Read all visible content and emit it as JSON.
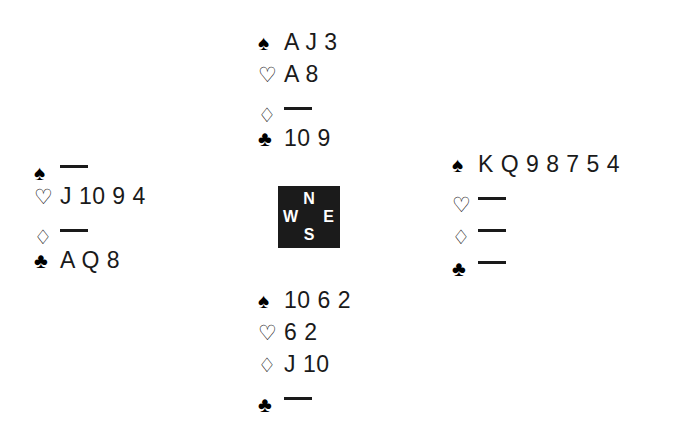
{
  "diagram": {
    "type": "bridge-hand-diagram",
    "background_color": "#ffffff",
    "ink_color": "#1a1a1a"
  },
  "suits": {
    "spade": {
      "symbol": "♠",
      "name": "spade-symbol",
      "filled": true
    },
    "heart": {
      "symbol": "♡",
      "name": "heart-symbol",
      "filled": false
    },
    "diamond": {
      "symbol": "♢",
      "name": "diamond-symbol",
      "filled": false
    },
    "club": {
      "symbol": "♣",
      "name": "club-symbol",
      "filled": true
    }
  },
  "void_marker": "—",
  "compass": {
    "background_color": "#1b1b1b",
    "text_color": "#ffffff",
    "north": "N",
    "west": "W",
    "east": "E",
    "south": "S"
  },
  "hands": {
    "north": {
      "label": "North",
      "spades": "A J 3",
      "hearts": "A 8",
      "diamonds": "",
      "clubs": "10 9",
      "diamonds_void": true,
      "spades_void": false,
      "hearts_void": false,
      "clubs_void": false
    },
    "west": {
      "label": "West",
      "spades": "",
      "hearts": "J 10 9 4",
      "diamonds": "",
      "clubs": "A Q 8",
      "spades_void": true,
      "hearts_void": false,
      "diamonds_void": true,
      "clubs_void": false
    },
    "east": {
      "label": "East",
      "spades": "K Q 9 8 7 5 4",
      "hearts": "",
      "diamonds": "",
      "clubs": "",
      "spades_void": false,
      "hearts_void": true,
      "diamonds_void": true,
      "clubs_void": true
    },
    "south": {
      "label": "South",
      "spades": "10 6 2",
      "hearts": "6 2",
      "diamonds": "J 10",
      "clubs": "",
      "spades_void": false,
      "hearts_void": false,
      "diamonds_void": false,
      "clubs_void": true
    }
  }
}
